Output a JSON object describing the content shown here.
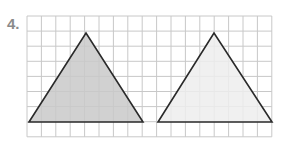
{
  "problem": {
    "number_label": "4."
  },
  "grid": {
    "x0": 27,
    "y0": 16,
    "cols": 17,
    "rows": 8,
    "cell_w": 14.4,
    "cell_h": 15.1,
    "line_color": "#c8c8c8"
  },
  "figures": [
    {
      "name": "shaded-triangle",
      "points": [
        [
          29,
          122
        ],
        [
          86,
          33
        ],
        [
          143,
          122
        ]
      ],
      "fill": "#c9c9c9",
      "stroke": "#2a2a2a"
    },
    {
      "name": "light-triangle",
      "points": [
        [
          158,
          122
        ],
        [
          214,
          33
        ],
        [
          272,
          122
        ]
      ],
      "fill": "#ededed",
      "stroke": "#2a2a2a"
    }
  ]
}
